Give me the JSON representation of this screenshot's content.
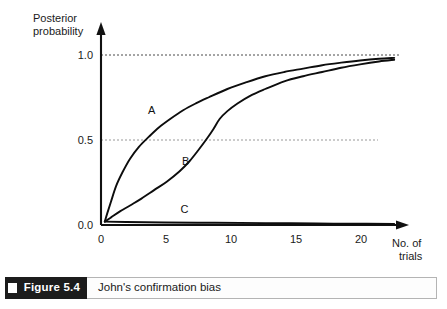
{
  "figure": {
    "number_label": "Figure 5.4",
    "caption": "John's confirmation bias"
  },
  "chart_data": {
    "type": "line",
    "title": "",
    "xlabel_line1": "No. of",
    "xlabel_line2": "trials",
    "ylabel_line1": "Posterior",
    "ylabel_line2": "probability",
    "xlim": [
      0,
      23.5
    ],
    "ylim": [
      0.0,
      1.08
    ],
    "xticks": [
      0,
      5,
      10,
      15,
      20
    ],
    "xtick_labels": [
      "0",
      "5",
      "10",
      "15",
      "20"
    ],
    "yticks": [
      0.0,
      0.5,
      1.0
    ],
    "ytick_labels": [
      "0.0",
      "0.5",
      "1.0"
    ],
    "grid": "horizontal-dotted-at-0.5-and-1.0",
    "legend": "inline-curve-labels",
    "axis_color": "#111111",
    "curve_color": "#0d0d0d",
    "gridline_color": "#4a4a4a",
    "series": [
      {
        "name": "A",
        "label": "A",
        "label_x": 4.0,
        "label_y": 0.675,
        "description": "Rapid early rise, concave, crosses 0.5 near trial 3.8, saturates toward 1.0",
        "x": [
          0.3,
          0.5,
          0.8,
          1.2,
          1.7,
          2.3,
          3.0,
          3.8,
          4.6,
          5.5,
          6.5,
          7.5,
          8.5,
          10.0,
          11.5,
          13.0,
          14.5,
          16.0,
          17.5,
          19.0,
          20.5,
          22.0,
          23.2
        ],
        "y": [
          0.02,
          0.07,
          0.14,
          0.23,
          0.31,
          0.39,
          0.46,
          0.52,
          0.575,
          0.625,
          0.675,
          0.715,
          0.75,
          0.8,
          0.84,
          0.875,
          0.9,
          0.92,
          0.94,
          0.955,
          0.968,
          0.978,
          0.983
        ]
      },
      {
        "name": "B",
        "label": "B",
        "label_x": 6.7,
        "label_y": 0.375,
        "description": "S-shaped (sigmoid) curve, slow start, steep rise near trial 9, crosses 0.5 near trial 9.0",
        "x": [
          0.3,
          0.8,
          1.5,
          2.3,
          3.2,
          4.2,
          5.2,
          6.2,
          7.0,
          7.8,
          8.4,
          8.9,
          9.4,
          10.0,
          10.8,
          11.8,
          13.0,
          14.5,
          16.0,
          17.5,
          19.0,
          20.5,
          22.0,
          23.2
        ],
        "y": [
          0.02,
          0.045,
          0.08,
          0.115,
          0.155,
          0.205,
          0.255,
          0.315,
          0.375,
          0.45,
          0.51,
          0.565,
          0.625,
          0.67,
          0.715,
          0.76,
          0.8,
          0.845,
          0.875,
          0.9,
          0.925,
          0.945,
          0.962,
          0.972
        ]
      },
      {
        "name": "C",
        "label": "C",
        "label_x": 6.6,
        "label_y": 0.095,
        "description": "Essentially flat, stays just above zero for all trials",
        "x": [
          0.3,
          2.0,
          5.0,
          9.0,
          13.0,
          17.0,
          21.0,
          23.2
        ],
        "y": [
          0.02,
          0.018,
          0.015,
          0.013,
          0.011,
          0.009,
          0.007,
          0.006
        ]
      }
    ]
  }
}
